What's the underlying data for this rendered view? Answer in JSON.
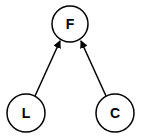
{
  "diagram": {
    "type": "directed-graph",
    "nodes": [
      {
        "id": "F",
        "label": "F",
        "cx": 70,
        "cy": 24,
        "r": 18
      },
      {
        "id": "L",
        "label": "L",
        "cx": 26,
        "cy": 113,
        "r": 19
      },
      {
        "id": "C",
        "label": "C",
        "cx": 115,
        "cy": 113,
        "r": 19
      }
    ],
    "edges": [
      {
        "from": "L",
        "to": "F"
      },
      {
        "from": "C",
        "to": "F"
      }
    ],
    "colors": {
      "stroke": "#000000",
      "fill": "#ffffff"
    }
  }
}
